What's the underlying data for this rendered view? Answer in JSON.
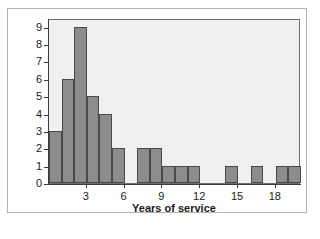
{
  "chart_data": {
    "type": "bar",
    "title": "",
    "subtitle": "",
    "xlabel": "Years of service",
    "ylabel": "Frequency",
    "xlim": [
      0,
      20
    ],
    "ylim": [
      0,
      9.5
    ],
    "grid": false,
    "legend": null,
    "bin_width": 1,
    "bin_starts": [
      0,
      1,
      2,
      3,
      4,
      5,
      6,
      7,
      8,
      9,
      10,
      11,
      12,
      13,
      14,
      15,
      16,
      17,
      18,
      19
    ],
    "categories": [
      "0-1",
      "1-2",
      "2-3",
      "3-4",
      "4-5",
      "5-6",
      "6-7",
      "7-8",
      "8-9",
      "9-10",
      "10-11",
      "11-12",
      "12-13",
      "13-14",
      "14-15",
      "15-16",
      "16-17",
      "17-18",
      "18-19",
      "19-20"
    ],
    "values": [
      3,
      6,
      9,
      5,
      4,
      2,
      0,
      2,
      2,
      1,
      1,
      1,
      0,
      0,
      1,
      0,
      1,
      0,
      1,
      1
    ],
    "x_ticks": [
      3,
      6,
      9,
      12,
      15,
      18
    ],
    "x_tick_labels": [
      "3",
      "6",
      "9",
      "12",
      "15",
      "18"
    ],
    "y_ticks": [
      0,
      1,
      2,
      3,
      4,
      5,
      6,
      7,
      8,
      9
    ],
    "y_tick_labels": [
      "0",
      "1",
      "2",
      "3",
      "4",
      "5",
      "6",
      "7",
      "8",
      "9"
    ],
    "colors": {
      "bar_fill": "#8c8c8c",
      "bar_edge": "#4a4a4a",
      "panel_background": "#f0f0f0",
      "panel_border": "#6e6e6e",
      "axis": "#3c3c3c",
      "figure_background": "#ffffff",
      "frame_border": "#b4b4b4",
      "text": "#1a1a1a"
    }
  }
}
